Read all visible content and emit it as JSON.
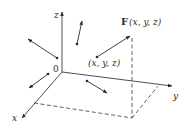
{
  "diagram": {
    "axes": {
      "x_label": "x",
      "y_label": "y",
      "z_label": "z",
      "origin_label": "0"
    },
    "point_label": "(x, y, z)",
    "field_vector_label": {
      "name": "F",
      "args": "(x, y, z)"
    },
    "colors": {
      "line": "#3a3a3a",
      "background": "#ffffff"
    },
    "vectors": [
      {
        "from": [
          57,
          58
        ],
        "to": [
          27,
          38
        ]
      },
      {
        "from": [
          77,
          44
        ],
        "to": [
          82,
          20
        ]
      },
      {
        "from": [
          48,
          74
        ],
        "to": [
          28,
          89
        ]
      },
      {
        "from": [
          87,
          81
        ],
        "to": [
          108,
          94
        ]
      },
      {
        "from": [
          97,
          57
        ],
        "to": [
          131,
          35
        ],
        "label": "F(x, y, z)"
      }
    ]
  }
}
